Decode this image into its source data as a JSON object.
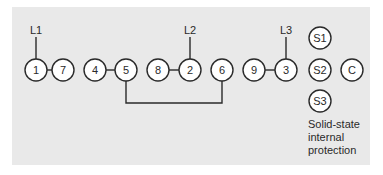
{
  "diagram": {
    "type": "terminal-connection-diagram",
    "background_color": "#e9e9e9",
    "line_color": "#2a2a2a",
    "leads": [
      {
        "label": "L1",
        "terminal": "1"
      },
      {
        "label": "L2",
        "terminal": "2"
      },
      {
        "label": "L3",
        "terminal": "3"
      }
    ],
    "terminals": [
      {
        "id": "1",
        "label": "1"
      },
      {
        "id": "7",
        "label": "7"
      },
      {
        "id": "4",
        "label": "4"
      },
      {
        "id": "5",
        "label": "5"
      },
      {
        "id": "8",
        "label": "8"
      },
      {
        "id": "2",
        "label": "2"
      },
      {
        "id": "6",
        "label": "6"
      },
      {
        "id": "9",
        "label": "9"
      },
      {
        "id": "3",
        "label": "3"
      },
      {
        "id": "S1",
        "label": "S1"
      },
      {
        "id": "S2",
        "label": "S2"
      },
      {
        "id": "S3",
        "label": "S3"
      },
      {
        "id": "C",
        "label": "C"
      }
    ],
    "connections": [
      [
        "1",
        "7"
      ],
      [
        "4",
        "5"
      ],
      [
        "8",
        "2"
      ],
      [
        "9",
        "3"
      ],
      [
        "5",
        "6"
      ]
    ],
    "note_lines": [
      "Solid-state",
      "internal",
      "protection"
    ]
  }
}
